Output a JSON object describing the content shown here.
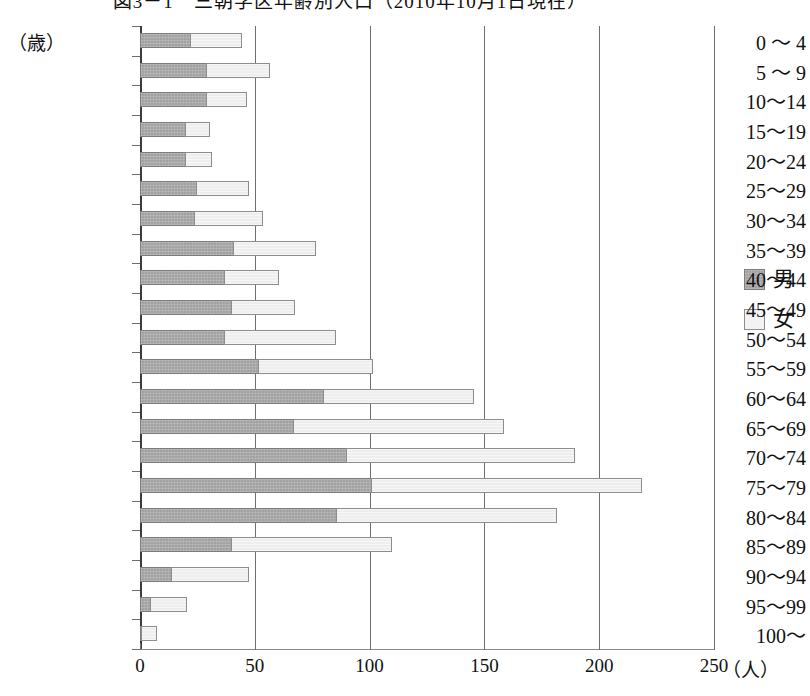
{
  "chart_data": {
    "type": "bar",
    "orientation": "horizontal",
    "stacked": true,
    "title": "図3－1　三朝学区年齢別人口（2010年10月1日現在）",
    "xlabel": "",
    "xunit": "（人）",
    "ylabel": "（歳）",
    "xlim": [
      0,
      250
    ],
    "xticks": [
      0,
      50,
      100,
      150,
      200,
      250
    ],
    "xtick_labels": [
      "0",
      "50",
      "100",
      "150",
      "200",
      "250"
    ],
    "grid": "vertical",
    "legend_position": "right",
    "categories": [
      "0 ～ 4",
      "5 ～ 9",
      "10～14",
      "15～19",
      "20～24",
      "25～29",
      "30～34",
      "35～39",
      "40～44",
      "45～49",
      "50～54",
      "55～59",
      "60～64",
      "65～69",
      "70～74",
      "75～79",
      "80～84",
      "85～89",
      "90～94",
      "95～99",
      "100～"
    ],
    "series": [
      {
        "name": "男",
        "color": "#a2a2a2",
        "values": [
          22,
          29,
          29,
          20,
          20,
          25,
          24,
          41,
          37,
          40,
          37,
          52,
          80,
          67,
          90,
          101,
          86,
          40,
          14,
          5,
          1
        ]
      },
      {
        "name": "女",
        "color": "#eeeeee",
        "values": [
          23,
          28,
          18,
          11,
          12,
          23,
          30,
          36,
          24,
          28,
          49,
          50,
          66,
          92,
          100,
          118,
          96,
          70,
          34,
          16,
          7
        ]
      }
    ],
    "totals": [
      45,
      57,
      47,
      31,
      32,
      48,
      54,
      77,
      61,
      68,
      86,
      102,
      146,
      159,
      190,
      219,
      182,
      110,
      48,
      21,
      8
    ]
  },
  "legend": {
    "items": [
      {
        "label": "男",
        "swatch": "male-swatch"
      },
      {
        "label": "女",
        "swatch": "female-swatch"
      }
    ]
  }
}
